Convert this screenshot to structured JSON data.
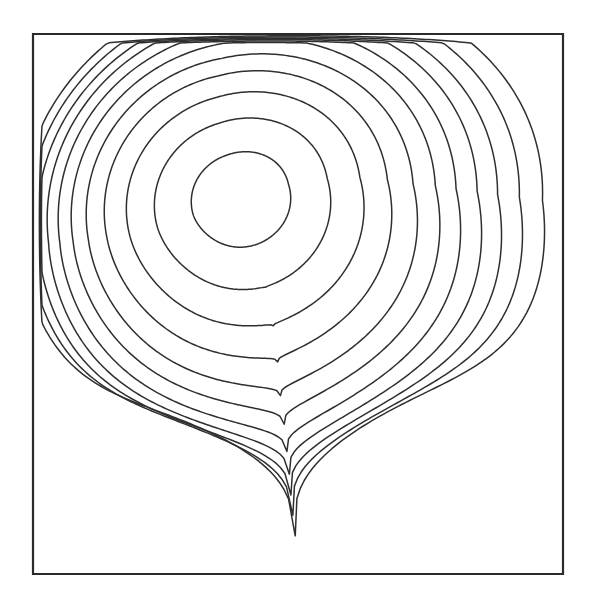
{
  "figure": {
    "title": "",
    "caption": "",
    "background_color": "#ffffff",
    "line_color": "#2f2f2f",
    "wall_color": "#2b2b2b"
  },
  "chart_data": {
    "type": "line",
    "subtype": "contour",
    "title": "",
    "subtitle": "",
    "xlabel": "",
    "ylabel": "",
    "xlim": [
      0,
      1
    ],
    "ylim": [
      0,
      1
    ],
    "grid": false,
    "legend": null,
    "annotations": [],
    "tick_labels": {
      "x": [],
      "y": []
    },
    "domain_box": {
      "x0_px": 33,
      "y0_px": 34,
      "x1_px": 563,
      "y1_px": 574,
      "label": "square cavity boundary"
    },
    "vortex_core_px": {
      "x": 241,
      "y": 200
    },
    "contour_count": 11,
    "levels": [
      0.1,
      0.2,
      0.3,
      0.4,
      0.5,
      0.6,
      0.7,
      0.8,
      0.9,
      0.95,
      0.99
    ],
    "contours": [
      {
        "level": 0.99,
        "label": "innermost",
        "cx": 241,
        "cy": 200,
        "rx": 50,
        "ry": 47,
        "rot": -18,
        "sx_low": 1.0,
        "sy_low": 1.0,
        "squash": 0.0,
        "shift_x": 0,
        "shift_y": 0
      },
      {
        "level": 0.95,
        "label": "c2",
        "cx": 242,
        "cy": 203,
        "rx": 88,
        "ry": 83,
        "rot": -16,
        "sx_low": 1.02,
        "sy_low": 1.04,
        "squash": 0.02,
        "shift_x": 2,
        "shift_y": 4
      },
      {
        "level": 0.9,
        "label": "c3",
        "cx": 244,
        "cy": 206,
        "rx": 118,
        "ry": 112,
        "rot": -14,
        "sx_low": 1.04,
        "sy_low": 1.08,
        "squash": 0.05,
        "shift_x": 4,
        "shift_y": 8
      },
      {
        "level": 0.8,
        "label": "c4",
        "cx": 246,
        "cy": 209,
        "rx": 142,
        "ry": 136,
        "rot": -12,
        "sx_low": 1.06,
        "sy_low": 1.12,
        "squash": 0.09,
        "shift_x": 7,
        "shift_y": 13
      },
      {
        "level": 0.7,
        "label": "c5",
        "cx": 249,
        "cy": 212,
        "rx": 163,
        "ry": 156,
        "rot": -10,
        "sx_low": 1.08,
        "sy_low": 1.16,
        "squash": 0.13,
        "shift_x": 10,
        "shift_y": 18
      },
      {
        "level": 0.6,
        "label": "c6",
        "cx": 252,
        "cy": 214,
        "rx": 181,
        "ry": 173,
        "rot": -9,
        "sx_low": 1.09,
        "sy_low": 1.19,
        "squash": 0.18,
        "shift_x": 13,
        "shift_y": 23
      },
      {
        "level": 0.5,
        "label": "c7",
        "cx": 255,
        "cy": 216,
        "rx": 197,
        "ry": 188,
        "rot": -8,
        "sx_low": 1.1,
        "sy_low": 1.22,
        "squash": 0.23,
        "shift_x": 17,
        "shift_y": 28
      },
      {
        "level": 0.4,
        "label": "c8",
        "cx": 259,
        "cy": 217,
        "rx": 212,
        "ry": 201,
        "rot": -7,
        "sx_low": 1.11,
        "sy_low": 1.24,
        "squash": 0.29,
        "shift_x": 22,
        "shift_y": 33
      },
      {
        "level": 0.3,
        "label": "c9",
        "cx": 263,
        "cy": 218,
        "rx": 226,
        "ry": 212,
        "rot": -6,
        "sx_low": 1.11,
        "sy_low": 1.26,
        "squash": 0.36,
        "shift_x": 28,
        "shift_y": 38
      },
      {
        "level": 0.2,
        "label": "c10",
        "cx": 268,
        "cy": 218,
        "rx": 240,
        "ry": 223,
        "rot": -5,
        "sx_low": 1.1,
        "sy_low": 1.28,
        "squash": 0.44,
        "shift_x": 35,
        "shift_y": 43
      },
      {
        "level": 0.1,
        "label": "outermost",
        "cx": 274,
        "cy": 218,
        "rx": 254,
        "ry": 234,
        "rot": -4,
        "sx_low": 1.08,
        "sy_low": 1.3,
        "squash": 0.53,
        "shift_x": 43,
        "shift_y": 48
      }
    ]
  }
}
